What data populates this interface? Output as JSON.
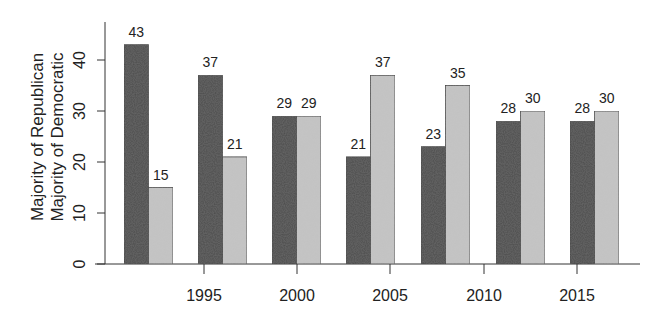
{
  "chart_data": {
    "type": "bar",
    "title": "",
    "xlabel": "",
    "ylabel": [
      "Majority of Republican",
      "Majority of Democratic"
    ],
    "ylim": [
      0,
      45
    ],
    "yticks": [
      0,
      10,
      20,
      30,
      40
    ],
    "xtick_labels": [
      "1995",
      "2000",
      "2005",
      "2010",
      "2015"
    ],
    "grid": false,
    "legend": null,
    "groups": 7,
    "series": [
      {
        "name": "Majority of Republican",
        "color": "#4a4a4a",
        "values": [
          43,
          37,
          29,
          21,
          23,
          28,
          28
        ]
      },
      {
        "name": "Majority of Democratic",
        "color": "#c4c4c4",
        "values": [
          15,
          21,
          29,
          37,
          35,
          30,
          30
        ]
      }
    ]
  },
  "layout": {
    "y_zero_px": 264,
    "px_per_unit": 5.1,
    "group_left_px": [
      124,
      198,
      272,
      346,
      421,
      496,
      570
    ],
    "bar_width_px": 24.5,
    "xtick_px": [
      204,
      297,
      390,
      484,
      577
    ],
    "y_axis_x_px": 105,
    "x_axis_start_px": 95,
    "x_axis_end_px": 640
  }
}
